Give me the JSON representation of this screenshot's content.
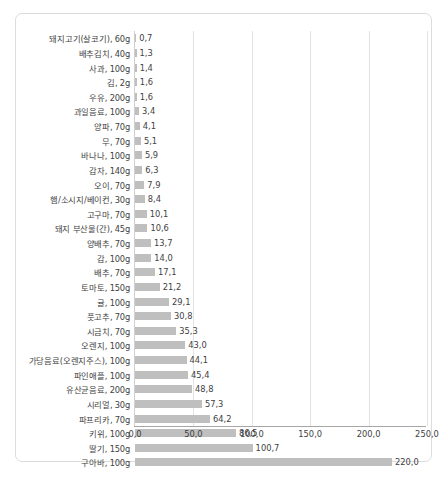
{
  "chart_data": {
    "type": "bar",
    "orientation": "horizontal",
    "title": "",
    "subtitle": "",
    "xlabel": "",
    "ylabel": "",
    "xlim": [
      0,
      250
    ],
    "grid": true,
    "legend": null,
    "decimal_separator": ",",
    "bar_color": "#bfbfbf",
    "axis_color": "#a6a6a6",
    "gridline_color": "#e2e2e2",
    "label_color": "#3f3f3f",
    "frame_color": "#dcdcdc",
    "xticks": [
      {
        "value": 0,
        "label": "0,0"
      },
      {
        "value": 50,
        "label": "50,0"
      },
      {
        "value": 100,
        "label": "100,0"
      },
      {
        "value": 150,
        "label": "150,0"
      },
      {
        "value": 200,
        "label": "200,0"
      },
      {
        "value": 250,
        "label": "250,0"
      }
    ],
    "categories": [
      "돼지고기(살코기), 60g",
      "배추김치, 40g",
      "사과, 100g",
      "김, 2g",
      "우유, 200g",
      "과일음료, 100g",
      "양파, 70g",
      "무, 70g",
      "바나나, 100g",
      "감자, 140g",
      "오이, 70g",
      "햄/소시지/베이컨, 30g",
      "고구마, 70g",
      "돼지 부산물(간), 45g",
      "양배추, 70g",
      "감, 100g",
      "배추, 70g",
      "토마토, 150g",
      "귤, 100g",
      "풋고추, 70g",
      "시금치, 70g",
      "오렌지, 100g",
      "가당음료(오렌지주스), 100g",
      "파인애플, 100g",
      "유산균음료, 200g",
      "시리얼, 30g",
      "파프리카, 70g",
      "키위, 100g",
      "딸기, 150g",
      "구아바, 100g"
    ],
    "values": [
      0.7,
      1.3,
      1.4,
      1.6,
      1.6,
      3.4,
      4.1,
      5.1,
      5.9,
      6.3,
      7.9,
      8.4,
      10.1,
      10.6,
      13.7,
      14.0,
      17.1,
      21.2,
      29.1,
      30.8,
      35.3,
      43.0,
      44.1,
      45.4,
      48.8,
      57.3,
      64.2,
      86.5,
      100.7,
      220.0
    ],
    "value_labels": [
      "0,7",
      "1,3",
      "1,4",
      "1,6",
      "1,6",
      "3,4",
      "4,1",
      "5,1",
      "5,9",
      "6,3",
      "7,9",
      "8,4",
      "10,1",
      "10,6",
      "13,7",
      "14,0",
      "17,1",
      "21,2",
      "29,1",
      "30,8",
      "35,3",
      "43,0",
      "44,1",
      "45,4",
      "48,8",
      "57,3",
      "64,2",
      "86,5",
      "100,7",
      "220,0"
    ]
  }
}
